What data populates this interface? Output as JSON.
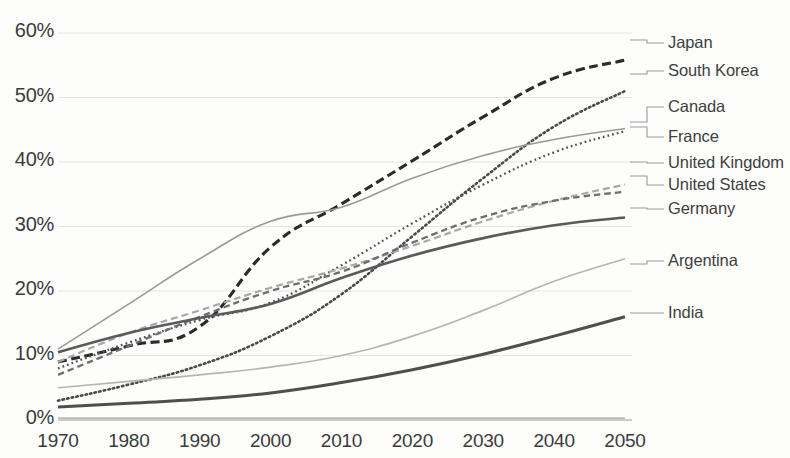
{
  "chart_data": {
    "type": "line",
    "title": "",
    "subtitle": "",
    "xlabel": "",
    "ylabel": "",
    "x": [
      1970,
      1980,
      1990,
      2000,
      2010,
      2020,
      2030,
      2040,
      2050
    ],
    "xlim": [
      1970,
      2050
    ],
    "ylim": [
      0,
      60
    ],
    "yunit": "%",
    "grid": true,
    "grid_axis": "y",
    "legend_position": "right",
    "x_tick_labels": [
      "1970",
      "1980",
      "1990",
      "2000",
      "2010",
      "2020",
      "2030",
      "2040",
      "2050"
    ],
    "y_tick_labels": [
      "0%",
      "10%",
      "20%",
      "30%",
      "40%",
      "50%",
      "60%"
    ],
    "y_tick_values": [
      0,
      10,
      20,
      30,
      40,
      50,
      60
    ],
    "series": [
      {
        "name": "Japan",
        "color": "#2b2b2b",
        "style": "dashed",
        "width": 3.1,
        "dash": "9,4.5",
        "values": [
          9.0,
          11.5,
          14.5,
          26.8,
          33.5,
          40.2,
          47.0,
          53.0,
          55.8
        ]
      },
      {
        "name": "South Korea",
        "color": "#4a4a4a",
        "style": "dotted",
        "width": 2.6,
        "dash": "1.5,3.2",
        "values": [
          3.0,
          5.5,
          8.5,
          13.0,
          19.5,
          28.5,
          37.5,
          45.5,
          51.0
        ]
      },
      {
        "name": "Canada",
        "color": "#9a9a9a",
        "style": "solid",
        "width": 1.6,
        "dash": "",
        "values": [
          11.0,
          18.0,
          25.0,
          30.8,
          33.0,
          37.5,
          41.0,
          43.5,
          45.2
        ]
      },
      {
        "name": "France",
        "color": "#555555",
        "style": "dash-dot",
        "width": 2.3,
        "dash": "1.8,3.0",
        "values": [
          8.0,
          12.0,
          15.5,
          18.2,
          24.0,
          30.5,
          36.5,
          41.5,
          44.8
        ]
      },
      {
        "name": "United Kingdom",
        "color": "#a8a8a8",
        "style": "dashed",
        "width": 2.2,
        "dash": "7,4",
        "values": [
          9.0,
          13.5,
          17.0,
          20.5,
          23.5,
          27.0,
          30.8,
          34.0,
          36.5
        ]
      },
      {
        "name": "United States",
        "color": "#6e6e6e",
        "style": "dashed",
        "width": 2.3,
        "dash": "6.5,4",
        "values": [
          7.0,
          11.5,
          16.0,
          20.0,
          23.0,
          27.5,
          31.5,
          34.0,
          35.4
        ]
      },
      {
        "name": "Germany",
        "color": "#5a5a5a",
        "style": "solid",
        "width": 2.6,
        "dash": "",
        "values": [
          10.5,
          13.5,
          15.8,
          18.0,
          22.0,
          25.5,
          28.2,
          30.2,
          31.4
        ]
      },
      {
        "name": "Argentina",
        "color": "#b5b5b5",
        "style": "solid",
        "width": 1.7,
        "dash": "",
        "values": [
          5.0,
          6.0,
          7.0,
          8.2,
          10.0,
          13.0,
          17.0,
          21.5,
          25.0
        ]
      },
      {
        "name": "India",
        "color": "#4f4f4f",
        "style": "solid",
        "width": 3.0,
        "dash": "",
        "values": [
          2.0,
          2.6,
          3.2,
          4.2,
          5.8,
          7.8,
          10.2,
          13.0,
          16.0
        ]
      },
      {
        "name": "Baseline",
        "color": "#bdbdbd",
        "style": "solid",
        "width": 1.8,
        "dash": "",
        "values": [
          0.3,
          0.3,
          0.3,
          0.3,
          0.3,
          0.3,
          0.3,
          0.3,
          0.3
        ]
      }
    ]
  },
  "legend": {
    "entries": [
      {
        "label": "Japan",
        "y": 43,
        "leader_to_y": 40,
        "color": "#9a9a9a"
      },
      {
        "label": "South Korea",
        "y": 71,
        "leader_to_y": 74,
        "color": "#9a9a9a"
      },
      {
        "label": "Canada",
        "y": 107,
        "leader_to_y": 122,
        "color": "#9a9a9a"
      },
      {
        "label": "France",
        "y": 137,
        "leader_to_y": 127,
        "color": "#9a9a9a"
      },
      {
        "label": "United Kingdom",
        "y": 163,
        "leader_to_y": 162,
        "color": "#9a9a9a"
      },
      {
        "label": "United States",
        "y": 185,
        "leader_to_y": 176,
        "color": "#9a9a9a"
      },
      {
        "label": "Germany",
        "y": 209,
        "leader_to_y": 208,
        "color": "#9a9a9a"
      },
      {
        "label": "Argentina",
        "y": 261,
        "leader_to_y": 264,
        "color": "#9a9a9a"
      },
      {
        "label": "India",
        "y": 313,
        "leader_to_y": 313,
        "color": "#9a9a9a"
      }
    ]
  }
}
